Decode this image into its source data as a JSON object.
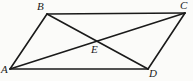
{
  "figure": {
    "type": "geometry-diagram",
    "shape": "parallelogram-with-diagonals",
    "background_color": "#fbfbf9",
    "stroke_color": "#1a1a1a",
    "label_color": "#1a1a1a",
    "width": 193,
    "height": 81,
    "vertices": [
      {
        "id": "A",
        "label": "A",
        "x": 10,
        "y": 69
      },
      {
        "id": "B",
        "label": "B",
        "x": 47,
        "y": 14
      },
      {
        "id": "C",
        "label": "C",
        "x": 185,
        "y": 13
      },
      {
        "id": "D",
        "label": "D",
        "x": 148,
        "y": 69
      },
      {
        "id": "E",
        "label": "E",
        "x": 97,
        "y": 42
      }
    ],
    "edges": [
      {
        "id": "AB",
        "from": "A",
        "to": "B",
        "kind": "side"
      },
      {
        "id": "BC",
        "from": "B",
        "to": "C",
        "kind": "side"
      },
      {
        "id": "CD",
        "from": "C",
        "to": "D",
        "kind": "side"
      },
      {
        "id": "DA",
        "from": "D",
        "to": "A",
        "kind": "side"
      },
      {
        "id": "AC",
        "from": "A",
        "to": "C",
        "kind": "diagonal"
      },
      {
        "id": "BD",
        "from": "B",
        "to": "D",
        "kind": "diagonal"
      }
    ],
    "intersection": {
      "id": "E",
      "label": "E",
      "of": [
        "AC",
        "BD"
      ],
      "x": 97,
      "y": 42
    }
  }
}
